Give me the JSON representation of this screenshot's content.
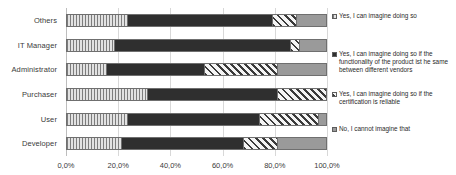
{
  "chart_data": {
    "type": "bar",
    "orientation": "horizontal",
    "stacked": true,
    "normalized": true,
    "title": "",
    "subtitle": "",
    "xlabel": "",
    "ylabel": "",
    "xlim": [
      0,
      100
    ],
    "grid": true,
    "legend_position": "right",
    "categories": [
      "Others",
      "IT Manager",
      "Administrator",
      "Purchaser",
      "User",
      "Developer"
    ],
    "xticks": [
      0,
      20,
      40,
      60,
      80,
      100
    ],
    "xticklabels": [
      "0,0%",
      "20,0%",
      "40,0%",
      "60,0%",
      "80,0%",
      "100,0%"
    ],
    "series": [
      {
        "name": "Yes, I can imagine doing so",
        "key": "yes",
        "fill": "vertical-hatch",
        "color": "#cfcfcf",
        "values": [
          23.0,
          18.0,
          15.0,
          31.0,
          23.0,
          21.0
        ]
      },
      {
        "name": "Yes, I can imagine doing so if the functionality of the product ist he same between different vendors",
        "key": "yes-if-functionality",
        "fill": "solid-dark",
        "color": "#2f2f2f",
        "values": [
          56.0,
          68.0,
          38.0,
          50.0,
          51.0,
          47.0
        ]
      },
      {
        "name": "Yes, I can imagine doing so if the certification is reliable",
        "key": "yes-if-certification",
        "fill": "diagonal-hatch",
        "color": "#f2f2f2",
        "values": [
          9.5,
          3.5,
          28.0,
          19.0,
          23.0,
          13.0
        ]
      },
      {
        "name": "No, I cannot imagine that",
        "key": "no",
        "fill": "solid-gray",
        "color": "#9a9a9a",
        "values": [
          11.5,
          10.5,
          19.0,
          0.0,
          3.0,
          19.0
        ]
      }
    ]
  },
  "legend": {
    "items": [
      {
        "label": "Yes, I can imagine doing so"
      },
      {
        "label": "Yes, I can imagine doing so if the functionality of the product ist he same between different vendors"
      },
      {
        "label": "Yes, I can imagine doing so if the certification is reliable"
      },
      {
        "label": "No, I cannot imagine that"
      }
    ]
  }
}
